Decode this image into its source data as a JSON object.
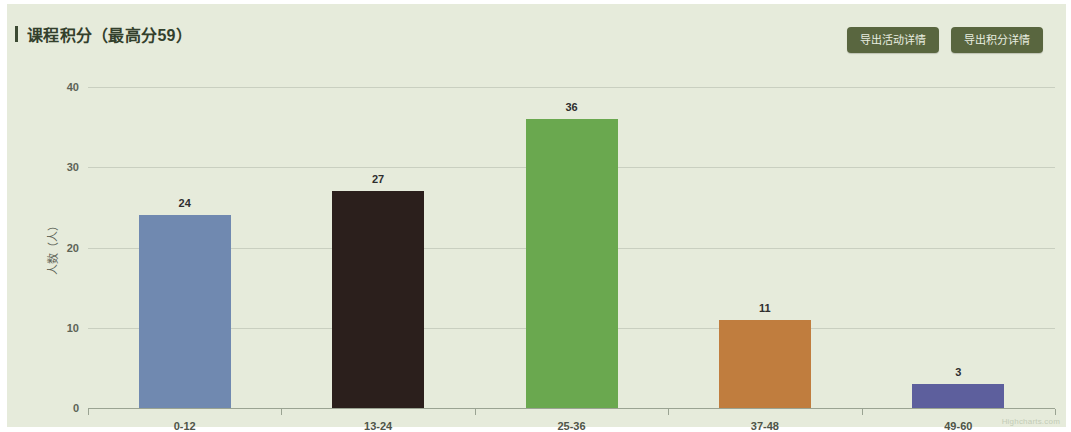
{
  "panel": {
    "title": "课程积分（最高分59）",
    "accent_color": "#3c4a33",
    "background_color": "#e6ebdb"
  },
  "header": {
    "buttons": [
      {
        "label": "导出活动详情",
        "name": "export-activity-detail-button"
      },
      {
        "label": "导出积分详情",
        "name": "export-points-detail-button"
      }
    ],
    "button_color": "#59663f"
  },
  "watermark": "Highcharts.com",
  "chart_data": {
    "type": "bar",
    "title": "课程积分（最高分59）",
    "xlabel": "",
    "ylabel": "人数（人）",
    "categories": [
      "0-12",
      "13-24",
      "25-36",
      "37-48",
      "49-60"
    ],
    "values": [
      24,
      27,
      36,
      11,
      3
    ],
    "colors": [
      "#7089b0",
      "#2b1f1c",
      "#6aa84f",
      "#c07d3e",
      "#5d5f9d"
    ],
    "ylim": [
      0,
      40
    ],
    "yticks": [
      0,
      10,
      20,
      30,
      40
    ],
    "grid": true,
    "legend": false,
    "data_labels": true
  }
}
